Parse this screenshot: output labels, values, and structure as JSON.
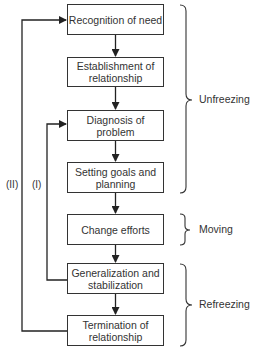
{
  "diagram": {
    "steps": [
      {
        "label": "Recognition of need"
      },
      {
        "label": "Establishment of relationship"
      },
      {
        "label": "Diagnosis of problem"
      },
      {
        "label": "Setting goals and planning"
      },
      {
        "label": "Change efforts"
      },
      {
        "label": "Generalization and stabilization"
      },
      {
        "label": "Termination of relationship"
      }
    ],
    "phases": [
      {
        "label": "Unfreezing",
        "covers": [
          "Recognition of need",
          "Establishment of relationship",
          "Diagnosis of problem",
          "Setting goals and planning"
        ]
      },
      {
        "label": "Moving",
        "covers": [
          "Change efforts"
        ]
      },
      {
        "label": "Refreezing",
        "covers": [
          "Generalization and stabilization",
          "Termination of relationship"
        ]
      }
    ],
    "loops": [
      {
        "label": "(I)",
        "from": "Generalization and stabilization",
        "to": "Diagnosis of problem"
      },
      {
        "label": "(II)",
        "from": "Termination of relationship",
        "to": "Recognition of need"
      }
    ]
  }
}
